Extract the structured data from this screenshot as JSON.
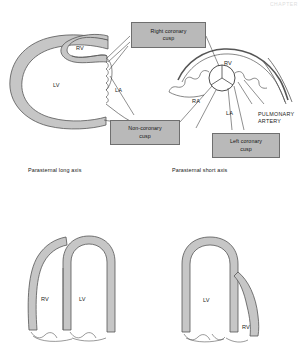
{
  "header": {
    "running_text": "CHAPTER"
  },
  "figure": {
    "colors": {
      "myocardium_fill": "#c6c6c6",
      "callout_fill": "#b9b9b9",
      "outline": "#555555",
      "leader_line": "#333333",
      "text": "#141414"
    },
    "panels": [
      {
        "id": "parasternal-long-axis",
        "caption": "Parasternal long axis",
        "chamber_labels": [
          {
            "key": "rv",
            "text": "RV"
          },
          {
            "key": "lv",
            "text": "LV"
          },
          {
            "key": "la",
            "text": "LA"
          }
        ]
      },
      {
        "id": "parasternal-short-axis",
        "caption": "Parasternal short axis",
        "chamber_labels": [
          {
            "key": "rv",
            "text": "RV"
          },
          {
            "key": "ra",
            "text": "RA"
          },
          {
            "key": "la",
            "text": "LA"
          }
        ],
        "vessel_labels": [
          {
            "key": "pulmonary-artery",
            "line1": "PULMONARY",
            "line2": "ARTERY"
          }
        ]
      },
      {
        "id": "apical-view-left",
        "caption": "",
        "chamber_labels": [
          {
            "key": "rv",
            "text": "RV"
          },
          {
            "key": "lv",
            "text": "LV"
          }
        ]
      },
      {
        "id": "apical-view-right",
        "caption": "",
        "chamber_labels": [
          {
            "key": "lv",
            "text": "LV"
          },
          {
            "key": "rv",
            "text": "RV"
          }
        ]
      }
    ],
    "callouts": [
      {
        "id": "right-coronary-cusp",
        "line1": "Right coronary",
        "line2": "cusp"
      },
      {
        "id": "non-coronary-cusp",
        "line1": "Non-coronary",
        "line2": "cusp"
      },
      {
        "id": "left-coronary-cusp",
        "line1": "Left coronary",
        "line2": "cusp"
      }
    ]
  }
}
